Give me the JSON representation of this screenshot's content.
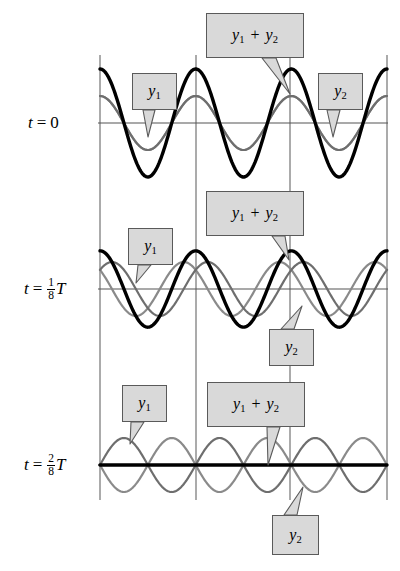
{
  "figure": {
    "background": "#ffffff",
    "width": 400,
    "height": 571
  },
  "colors": {
    "wave_y1": "#8a8a8a",
    "wave_y2": "#6e6e6e",
    "wave_sum": "#000000",
    "grid": "#666666",
    "axis": "#555555",
    "callout_fill": "#d9d9d9",
    "callout_border": "#5a5a5a",
    "leader": "#555555"
  },
  "row_labels": [
    {
      "id": "t0",
      "t": "t",
      "eq": "=",
      "value": "0",
      "type": "plain",
      "x": 28,
      "y": 113
    },
    {
      "id": "t1",
      "t": "t",
      "eq": "=",
      "num": "1",
      "den": "8",
      "suffix": "T",
      "type": "fraction",
      "x": 24,
      "y": 277
    },
    {
      "id": "t2",
      "t": "t",
      "eq": "=",
      "num": "2",
      "den": "8",
      "suffix": "T",
      "type": "fraction",
      "x": 24,
      "y": 453
    }
  ],
  "callouts": [
    {
      "id": "sum-row1",
      "text": "y1 + y2",
      "base": "y",
      "sub1": "1",
      "op": "+",
      "base2": "y",
      "sub2": "2",
      "x": 206,
      "y": 13,
      "w": 98,
      "h": 45,
      "tail": {
        "x1": 262,
        "y1": 58,
        "x2": 276,
        "y2": 58,
        "tx": 290,
        "ty": 94
      }
    },
    {
      "id": "y1-row1",
      "text": "y1",
      "base": "y",
      "sub1": "1",
      "x": 132,
      "y": 73,
      "w": 45,
      "h": 37,
      "tail": {
        "x1": 143,
        "y1": 110,
        "x2": 155,
        "y2": 110,
        "tx": 148,
        "ty": 137
      }
    },
    {
      "id": "y2-row1",
      "text": "y2",
      "base": "y",
      "sub1": "2",
      "x": 318,
      "y": 73,
      "w": 45,
      "h": 37,
      "tail": {
        "x1": 327,
        "y1": 110,
        "x2": 340,
        "y2": 110,
        "tx": 333,
        "ty": 137
      }
    },
    {
      "id": "sum-row2",
      "text": "y1 + y2",
      "base": "y",
      "sub1": "1",
      "op": "+",
      "base2": "y",
      "sub2": "2",
      "x": 206,
      "y": 191,
      "w": 98,
      "h": 45,
      "tail": {
        "x1": 272,
        "y1": 236,
        "x2": 285,
        "y2": 236,
        "tx": 289,
        "ty": 260
      }
    },
    {
      "id": "y1-row2",
      "text": "y1",
      "base": "y",
      "sub1": "1",
      "x": 128,
      "y": 228,
      "w": 45,
      "h": 37,
      "tail": {
        "x1": 138,
        "y1": 265,
        "x2": 151,
        "y2": 265,
        "tx": 136,
        "ty": 283
      }
    },
    {
      "id": "y2-row2",
      "text": "y2",
      "base": "y",
      "sub1": "2",
      "x": 269,
      "y": 329,
      "w": 45,
      "h": 37,
      "tail": {
        "x1": 281,
        "y1": 329,
        "x2": 294,
        "y2": 329,
        "tx": 302,
        "ty": 306
      }
    },
    {
      "id": "y1-row3",
      "text": "y1",
      "base": "y",
      "sub1": "1",
      "x": 122,
      "y": 385,
      "w": 45,
      "h": 37,
      "tail": {
        "x1": 131,
        "y1": 422,
        "x2": 144,
        "y2": 422,
        "tx": 130,
        "ty": 444
      }
    },
    {
      "id": "sum-row3",
      "text": "y1 + y2",
      "base": "y",
      "sub1": "1",
      "op": "+",
      "base2": "y",
      "sub2": "2",
      "x": 207,
      "y": 382,
      "w": 98,
      "h": 45,
      "tail": {
        "x1": 267,
        "y1": 427,
        "x2": 280,
        "y2": 427,
        "tx": 268,
        "ty": 465
      }
    },
    {
      "id": "y2-row3",
      "text": "y2",
      "base": "y",
      "sub1": "2",
      "x": 272,
      "y": 515,
      "w": 47,
      "h": 40,
      "tail": {
        "x1": 284,
        "y1": 515,
        "x2": 297,
        "y2": 515,
        "tx": 303,
        "ty": 487
      }
    }
  ],
  "chart_data": {
    "type": "line",
    "xlabel": "",
    "ylabel": "",
    "grid": true,
    "legend_position": "inline-callouts",
    "plot_area": {
      "x_left": 100,
      "x_right": 387,
      "amplitude_unit_px": 27
    },
    "vertical_gridlines_x": [
      100,
      196,
      290,
      387
    ],
    "wavelength_px": 95.666,
    "series_names": [
      "y1",
      "y2",
      "y1 + y2"
    ],
    "rows": [
      {
        "label": "t = 0",
        "baseline_y": 123,
        "phase_y1_deg": 0,
        "phase_y2_deg": 0,
        "amplitude_y1": 1.0,
        "amplitude_y2": 1.0,
        "amplitude_sum": 2.0,
        "description": "y1 and y2 exactly in phase; constructive interference gives double amplitude"
      },
      {
        "label": "t = 1/8 T",
        "baseline_y": 289,
        "phase_y1_deg": 45,
        "phase_y2_deg": -45,
        "amplitude_y1": 1.0,
        "amplitude_y2": 1.0,
        "amplitude_sum": 1.414,
        "description": "y1 shifted right and y2 shifted left by 45 degrees; sum amplitude sqrt(2)"
      },
      {
        "label": "t = 2/8 T",
        "baseline_y": 465,
        "phase_y1_deg": 90,
        "phase_y2_deg": -90,
        "amplitude_y1": 1.0,
        "amplitude_y2": 1.0,
        "amplitude_sum": 0.0,
        "description": "y1 and y2 exactly out of phase; total destructive interference, sum is flat zero"
      }
    ]
  }
}
